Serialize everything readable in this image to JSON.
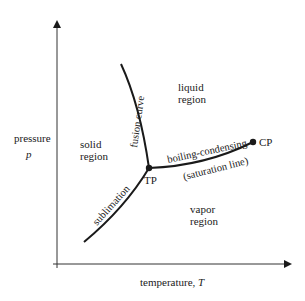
{
  "diagram": {
    "axes": {
      "y_label": "pressure",
      "y_symbol": "p",
      "x_label": "temperature,",
      "x_symbol": "T"
    },
    "regions": {
      "solid": [
        "solid",
        "region"
      ],
      "liquid": [
        "liquid",
        "region"
      ],
      "vapor": [
        "vapor",
        "region"
      ]
    },
    "curves": {
      "fusion": "fusion curve",
      "sublimation": "sublimation",
      "boiling": "boiling-condensing",
      "saturation": "(saturation line)"
    },
    "points": {
      "triple": "TP",
      "critical": "CP"
    },
    "colors": {
      "line": "#1a1a1a",
      "axis": "#333333",
      "background": "#ffffff"
    }
  }
}
